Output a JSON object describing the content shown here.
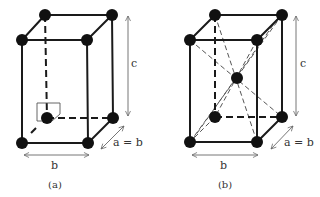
{
  "figure": {
    "panels": [
      {
        "id": "a",
        "caption": "(a)",
        "structure": "body-centered tetragonal cell with inset marker at back-bottom-left atom",
        "labels": {
          "height": "c",
          "width": "b",
          "depth": "a = b"
        }
      },
      {
        "id": "b",
        "caption": "(b)",
        "structure": "body-centered tetragonal cell with body diagonals and central atom",
        "labels": {
          "height": "c",
          "width": "b",
          "depth": "a = b"
        }
      }
    ],
    "colors": {
      "atom": "#111111",
      "edge": "#1a1a1a",
      "diagonal": "#555555",
      "arrow": "#666666",
      "background": "#ffffff"
    }
  }
}
